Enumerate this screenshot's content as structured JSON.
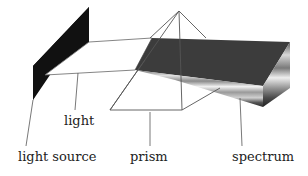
{
  "diagram": {
    "labels": {
      "light": "light",
      "light_source": "light source",
      "prism": "prism",
      "spectrum": "spectrum"
    },
    "colors": {
      "background": "#ffffff",
      "light_source": "#111111",
      "spectrum_top": "#3c3c3c",
      "outline": "#555555",
      "text": "#222222"
    }
  }
}
